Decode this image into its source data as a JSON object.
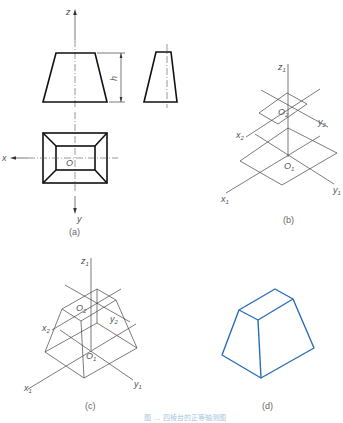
{
  "figure": {
    "panels": [
      {
        "id": "a",
        "label": "(a)",
        "description": "Orthographic views of a frustum of a rectangular pyramid (front, side, top)"
      },
      {
        "id": "b",
        "label": "(b)",
        "description": "Axonometric axes with top and bottom base planes"
      },
      {
        "id": "c",
        "label": "(c)",
        "description": "Construction of the frustum in axonometric projection"
      },
      {
        "id": "d",
        "label": "(d)",
        "description": "Finished axonometric drawing of the frustum"
      }
    ],
    "labels": {
      "z": "z",
      "x": "x",
      "y": "y",
      "o": "O",
      "h": "h",
      "z1": "z",
      "z1_sub": "1",
      "x1": "x",
      "x1_sub": "1",
      "y1": "y",
      "y1_sub": "1",
      "o1": "O",
      "o1_sub": "1",
      "x2": "x",
      "x2_sub": "2",
      "y2": "y",
      "y2_sub": "2",
      "o2": "O",
      "o2_sub": "2"
    },
    "caption": "图 ... 四棱台的正等轴测图"
  },
  "colors": {
    "line": "#111111",
    "construction": "#444444",
    "result": "#2a6db5",
    "caption": "#a8c6e0"
  }
}
